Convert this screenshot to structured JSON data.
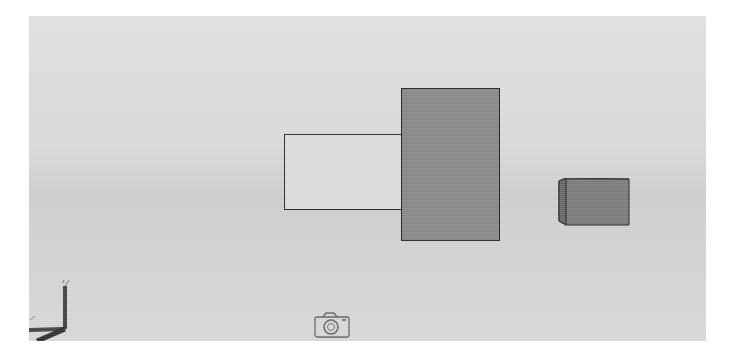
{
  "viewport": {
    "background": {
      "top": "#e3e3e3",
      "middle": "#d0d0d0",
      "bottom": "#dadada"
    },
    "objects": [
      {
        "name": "light-panel",
        "fill": "#dedede",
        "stroke": "#2a2a2a"
      },
      {
        "name": "dark-panel",
        "fill": "#8a8a8a",
        "stroke": "#222222"
      },
      {
        "name": "small-box",
        "fill": "#7e7e7e",
        "side_fill": "#6a6a6a",
        "stroke": "#222222"
      }
    ],
    "axis_indicator": {
      "label": "z",
      "icon": "axis-triad-icon"
    },
    "camera": {
      "icon": "camera-icon"
    }
  }
}
